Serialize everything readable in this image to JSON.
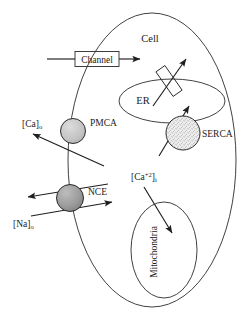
{
  "figure": {
    "type": "cell-calcium-signaling-diagram",
    "title_visible": false,
    "background_color": "#ffffff",
    "line_color": "#232323",
    "width": 249,
    "height": 314
  },
  "labels": {
    "cell": "Cell",
    "channel": "Channel",
    "pmca": "PMCA",
    "nce": "NCE",
    "er": "ER",
    "serca": "SERCA",
    "mitochondria": "Mitochondria",
    "ca_out_base": "[Ca]",
    "ca_out_sub": "o",
    "na_out_base": "[Na]",
    "na_out_sub": "o",
    "ca_in_base": "[Ca",
    "ca_in_sup": "+2",
    "ca_in_close": "]",
    "ca_in_sub": "i"
  },
  "shapes": {
    "cell_membrane": {
      "name": "cell-membrane-ellipse",
      "cx": 152,
      "cy": 160,
      "rx": 84,
      "ry": 147,
      "fill": "none",
      "stroke": "#232323"
    },
    "er_membrane": {
      "name": "er-ellipse",
      "cx": 172,
      "cy": 101,
      "rx": 53,
      "ry": 22,
      "fill": "none",
      "stroke": "#232323"
    },
    "mitochondria": {
      "name": "mitochondria-ellipse",
      "cx": 164,
      "cy": 250,
      "rx": 33,
      "ry": 48,
      "fill": "none",
      "stroke": "#232323"
    },
    "channel_box": {
      "name": "channel-box",
      "x": 75,
      "y": 51,
      "width": 44,
      "height": 15,
      "fill": "#ffffff",
      "stroke": "#232323"
    },
    "pmca_circle": {
      "name": "pmca-transporter-circle",
      "cx": 73,
      "cy": 131,
      "r": 12.5,
      "fill": "#c9c9c9",
      "stroke": "#232323"
    },
    "nce_circle": {
      "name": "nce-exchanger-circle",
      "cx": 70,
      "cy": 198,
      "r": 13.5,
      "fill": "#9a9a9a",
      "stroke": "#232323"
    },
    "serca_circle": {
      "name": "serca-pump-circle",
      "cx": 183,
      "cy": 133,
      "r": 17,
      "fill": "#e2e2e2",
      "stroke": "#232323",
      "texture": "stippled"
    },
    "er_channel_rect": {
      "name": "er-channel-rectangle",
      "cx": 169,
      "cy": 81,
      "width": 11,
      "height": 30,
      "rotation_deg": 27,
      "fill": "#ffffff",
      "stroke": "#232323"
    }
  },
  "arrows": [
    {
      "name": "channel-influx-arrow",
      "from": "extracellular",
      "to": "cytosol",
      "direction": "right"
    },
    {
      "name": "pmca-efflux-arrow",
      "from": "cytosol",
      "to": "extracellular",
      "direction": "up-left"
    },
    {
      "name": "nce-calcium-efflux-arrow",
      "from": "cytosol",
      "to": "extracellular",
      "direction": "left"
    },
    {
      "name": "nce-sodium-influx-arrow",
      "from": "extracellular",
      "to": "cytosol",
      "direction": "right"
    },
    {
      "name": "er-channel-release-arrow",
      "from": "er-lumen",
      "to": "cytosol",
      "direction": "up-right"
    },
    {
      "name": "serca-uptake-arrow",
      "from": "cytosol",
      "to": "er-lumen",
      "direction": "up-right"
    },
    {
      "name": "mitochondria-uptake-arrow",
      "from": "cytosol-calcium",
      "to": "mitochondria",
      "direction": "down-right"
    }
  ]
}
